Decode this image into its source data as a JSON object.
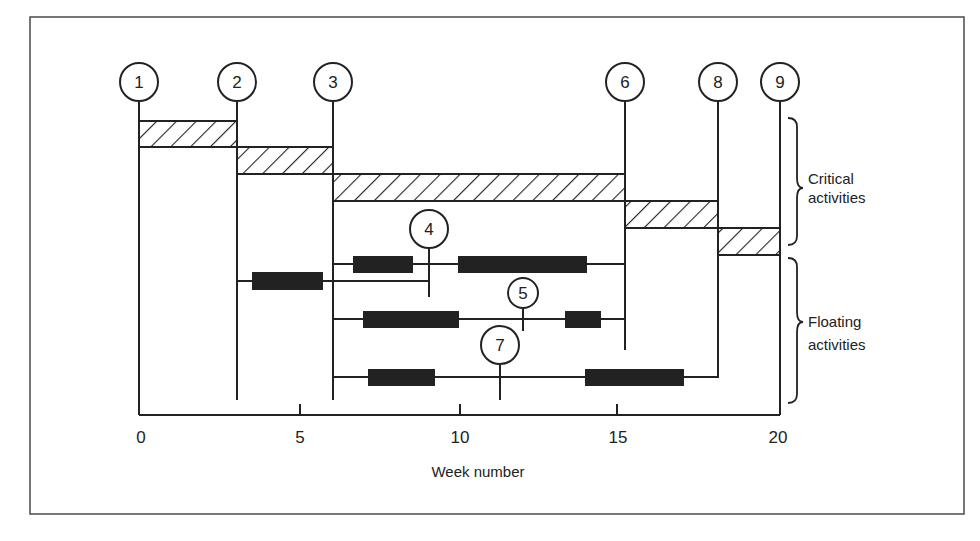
{
  "figure": {
    "x_axis": {
      "title": "Week number",
      "min": 0,
      "max": 20,
      "ticks": [
        0,
        5,
        10,
        15,
        20
      ],
      "tick_labels": [
        "0",
        "5",
        "10",
        "15",
        "20"
      ]
    },
    "nodes": [
      {
        "id": "1",
        "week": 0
      },
      {
        "id": "2",
        "week": 3
      },
      {
        "id": "3",
        "week": 6
      },
      {
        "id": "4",
        "week": 9.1
      },
      {
        "id": "5",
        "week": 12
      },
      {
        "id": "6",
        "week": 15.15
      },
      {
        "id": "7",
        "week": 11.25
      },
      {
        "id": "8",
        "week": 18.05
      },
      {
        "id": "9",
        "week": 20
      }
    ],
    "groups": {
      "critical": {
        "line1": "Critical",
        "line2": "activities"
      },
      "floating": {
        "line1": "Floating",
        "line2": "activities"
      }
    },
    "critical_activities": [
      {
        "from": "1",
        "to": "2",
        "start": 0,
        "end": 3
      },
      {
        "from": "2",
        "to": "3",
        "start": 3,
        "end": 6
      },
      {
        "from": "3",
        "to": "6",
        "start": 6,
        "end": 15.15
      },
      {
        "from": "6",
        "to": "8",
        "start": 15.15,
        "end": 18.05
      },
      {
        "from": "8",
        "to": "9",
        "start": 18.05,
        "end": 20
      }
    ],
    "floating_activities": [
      {
        "row": "A",
        "path": "3 → 4 → 6",
        "line_start": 6,
        "line_end": 15.15,
        "bars": [
          [
            6.7,
            8.5
          ],
          [
            9.95,
            13.95
          ]
        ]
      },
      {
        "row": "B",
        "path": "2 → 4",
        "line_start": 3,
        "line_end": 9.1,
        "bars": [
          [
            3.5,
            5.7
          ]
        ]
      },
      {
        "row": "C",
        "path": "3 → 5 → 6",
        "line_start": 6,
        "line_end": 15.15,
        "bars": [
          [
            7,
            10
          ],
          [
            13.3,
            14.4
          ]
        ]
      },
      {
        "row": "D",
        "path": "3 → 7 → 8",
        "line_start": 6,
        "line_end": 18.05,
        "bars": [
          [
            7.15,
            9.25
          ],
          [
            13.9,
            17
          ]
        ]
      }
    ]
  },
  "colors": {
    "ink": "#222222",
    "frame": "#555555",
    "background": "#ffffff"
  }
}
